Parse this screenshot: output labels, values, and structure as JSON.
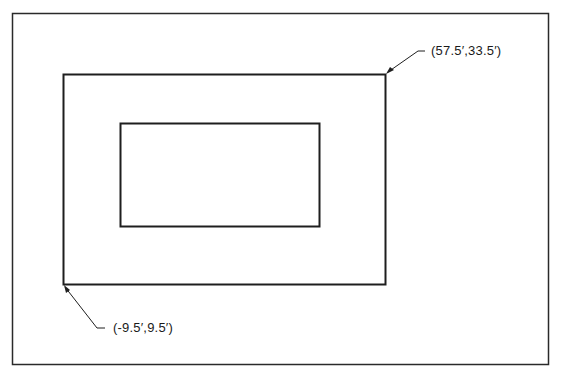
{
  "diagram": {
    "type": "site-plan-coordinates",
    "colors": {
      "background": "#ffffff",
      "stroke": "#1e1e1e",
      "text": "#1a1a1a"
    },
    "frame": {
      "x": 12,
      "y": 13,
      "width": 536,
      "height": 351
    },
    "outer_rectangle": {
      "x": 63,
      "y": 74,
      "width": 322,
      "height": 210
    },
    "inner_rectangle": {
      "x": 120,
      "y": 123,
      "width": 199,
      "height": 103
    },
    "callouts": [
      {
        "id": "upper-right-corner",
        "label": "(57.5′,33.5′)",
        "points_to": "outer rectangle upper-right corner"
      },
      {
        "id": "lower-left-corner",
        "label": "(-9.5′,9.5′)",
        "points_to": "outer rectangle lower-left corner"
      }
    ]
  }
}
